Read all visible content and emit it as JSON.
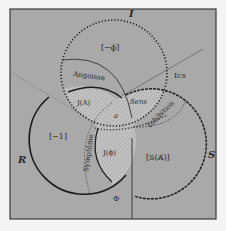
{
  "diagram": {
    "type": "borromean-knot",
    "colors": {
      "page": "#f4f4f4",
      "background": "#a9a9a9",
      "hatch_fill": "#c4c4c4",
      "line": "#1e1e1e",
      "thin_line": "#5a5a5a",
      "dashed_line": "#7a7a7a"
    },
    "rings": [
      {
        "id": "I",
        "label": "I",
        "style": "dotted",
        "name": "Imaginary"
      },
      {
        "id": "R",
        "label": "R",
        "style": "solid",
        "name": "Real"
      },
      {
        "id": "S",
        "label": "S",
        "style": "dashed",
        "name": "Symbolic"
      }
    ],
    "labels": {
      "ring_I": "I",
      "ring_R": "R",
      "ring_S": "S",
      "minus_phi": "[−ϕ]",
      "minus_one": "[−1]",
      "s_barred_a": "[S(A̸)]",
      "angoisse": "Angoisse",
      "symptome": "Symptôme",
      "inhibition": "Inhibition",
      "sens": "Sens",
      "ics": "Ics",
      "j_a": "J(A)",
      "j_phi": "J(ϕ)",
      "object_a": "a",
      "phi": "Φ"
    }
  }
}
